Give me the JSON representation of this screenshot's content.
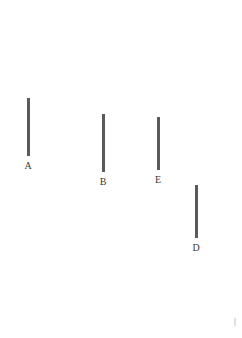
{
  "figure": {
    "width": 242,
    "height": 338,
    "background_color": "#ffffff",
    "stroke_color": "#5a5a5a",
    "label_color": "#3a3a3a"
  },
  "chart_data": {
    "type": "bar",
    "title": "",
    "subtitle": "",
    "xlabel": "",
    "ylabel": "",
    "grid": false,
    "legend": "none",
    "orientation": "vertical",
    "categories": [
      "A",
      "B",
      "E",
      "D"
    ],
    "values": [
      58,
      58,
      53,
      53
    ],
    "value_unit": "px",
    "ylim": [
      0,
      60
    ],
    "segments": [
      {
        "label": "A",
        "x": 28,
        "y_top": 98,
        "y_bottom": 156,
        "length": 58,
        "thickness": 3,
        "label_x": 28,
        "label_y": 161
      },
      {
        "label": "B",
        "x": 103,
        "y_top": 114,
        "y_bottom": 172,
        "length": 58,
        "thickness": 3,
        "label_x": 103,
        "label_y": 177
      },
      {
        "label": "E",
        "x": 158,
        "y_top": 117,
        "y_bottom": 170,
        "length": 53,
        "thickness": 3,
        "label_x": 158,
        "label_y": 175
      },
      {
        "label": "D",
        "x": 196,
        "y_top": 185,
        "y_bottom": 238,
        "length": 53,
        "thickness": 3,
        "label_x": 196,
        "label_y": 243
      }
    ]
  },
  "artifact": {
    "x": 234,
    "y": 318,
    "width": 2,
    "height": 8
  }
}
